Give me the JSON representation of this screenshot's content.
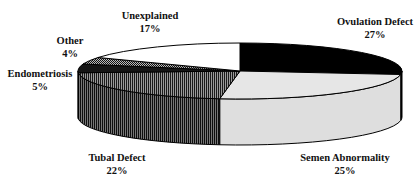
{
  "chart_data": {
    "type": "pie",
    "style": "3d-exploded-none",
    "title": "",
    "slices": [
      {
        "label": "Ovulation Defect",
        "value": 27,
        "display": "27%",
        "fill": "#000000",
        "pattern": "solid"
      },
      {
        "label": "Semen Abnormality",
        "value": 25,
        "display": "25%",
        "fill": "#e4e4e4",
        "pattern": "solid-light-gray"
      },
      {
        "label": "Tubal Defect",
        "value": 22,
        "display": "22%",
        "fill": "#555555",
        "pattern": "vertical-stripes"
      },
      {
        "label": "Endometriosis",
        "value": 5,
        "display": "5%",
        "fill": "#111111",
        "pattern": "dense-dark"
      },
      {
        "label": "Other",
        "value": 4,
        "display": "4%",
        "fill": "#6a6a6a",
        "pattern": "checker"
      },
      {
        "label": "Unexplained",
        "value": 17,
        "display": "17%",
        "fill": "#ffffff",
        "pattern": "solid-white"
      }
    ],
    "start_angle_deg": 90,
    "direction": "clockwise",
    "legend": "none (labels placed around pie)"
  },
  "labels": {
    "ovulation": {
      "name": "Ovulation Defect",
      "pct": "27%"
    },
    "semen": {
      "name": "Semen Abnormality",
      "pct": "25%"
    },
    "tubal": {
      "name": "Tubal Defect",
      "pct": "22%"
    },
    "endometriosis": {
      "name": "Endometriosis",
      "pct": "5%"
    },
    "other": {
      "name": "Other",
      "pct": "4%"
    },
    "unexplained": {
      "name": "Unexplained",
      "pct": "17%"
    }
  }
}
